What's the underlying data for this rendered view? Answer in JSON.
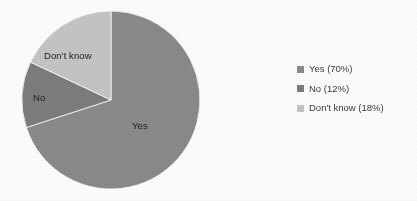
{
  "chart_data": {
    "type": "pie",
    "title": "",
    "categories": [
      "Yes",
      "No",
      "Don't know"
    ],
    "values": [
      70,
      12,
      18
    ],
    "value_unit": "percent",
    "start_angle_deg": 0,
    "direction": "clockwise",
    "legend_position": "right",
    "grid": false,
    "colors": [
      "#8b8b8b",
      "#7d7d7d",
      "#c6c6c6"
    ],
    "slice_labels": [
      {
        "text": "Yes",
        "x": 132,
        "y": 121
      },
      {
        "text": "No",
        "x": 33,
        "y": 93
      },
      {
        "text": "Don't know",
        "x": 44,
        "y": 51
      }
    ],
    "legend_entries": [
      {
        "label": "Yes (70%)",
        "color": "#8b8b8b"
      },
      {
        "label": "No (12%)",
        "color": "#7d7d7d"
      },
      {
        "label": "Don't know (18%)",
        "color": "#c6c6c6"
      }
    ]
  },
  "pie": {
    "center_x": 111,
    "center_y": 100,
    "radius": 89,
    "slices": [
      {
        "name": "Yes",
        "percent": 70,
        "color": "#8b8b8b",
        "start_deg": 0,
        "end_deg": 252
      },
      {
        "name": "No",
        "percent": 12,
        "color": "#7d7d7d",
        "start_deg": 252,
        "end_deg": 295.2
      },
      {
        "name": "Don't know",
        "percent": 18,
        "color": "#c6c6c6",
        "start_deg": 295.2,
        "end_deg": 360
      }
    ]
  },
  "labels": {
    "yes": "Yes",
    "no": "No",
    "dont_know": "Don't know"
  },
  "legend": {
    "rows": [
      {
        "label": "Yes (70%)",
        "color": "#8b8b8b"
      },
      {
        "label": "No (12%)",
        "color": "#7d7d7d"
      },
      {
        "label": "Don't know (18%)",
        "color": "#c6c6c6"
      }
    ]
  },
  "colors": {
    "background": "#ffffff",
    "yes": "#8b8b8b",
    "no": "#7d7d7d",
    "dont_know": "#c6c6c6",
    "label_text": "#1d1d1d",
    "legend_text": "#3a3a3a"
  }
}
